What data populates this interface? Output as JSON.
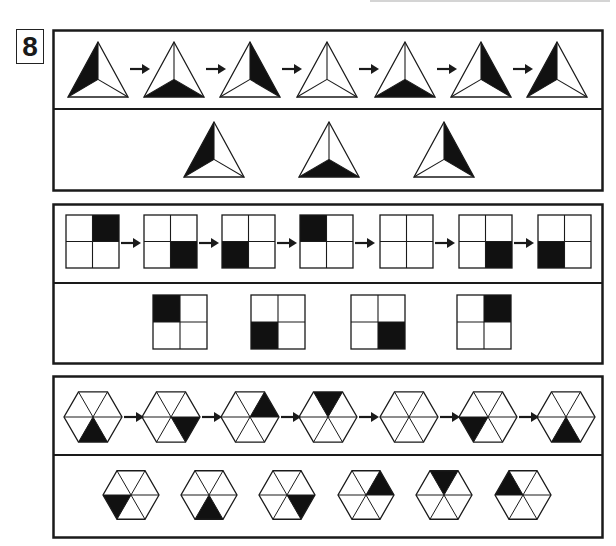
{
  "problem": {
    "number": "8"
  },
  "colors": {
    "ink": "#1a1a1a",
    "fill": "#111111",
    "background": "#ffffff"
  },
  "panels": [
    {
      "type": "triangle",
      "sequence": [
        "left",
        "bottom",
        "right",
        "none",
        "bottom",
        "right",
        "left"
      ],
      "options": [
        "left",
        "bottom",
        "right"
      ]
    },
    {
      "type": "square",
      "sequence": [
        "top-right",
        "bottom-right",
        "bottom-left",
        "top-left",
        "none",
        "bottom-right",
        "bottom-left"
      ],
      "options": [
        "top-left",
        "bottom-left",
        "bottom-right",
        "top-right"
      ]
    },
    {
      "type": "hexagon",
      "sequence": [
        "bottom",
        "lower-right",
        "upper-right",
        "top",
        "none",
        "lower-left",
        "bottom"
      ],
      "options": [
        "lower-left",
        "bottom",
        "lower-right",
        "upper-right",
        "top",
        "upper-left"
      ]
    }
  ],
  "icons": {
    "arrow": "right-arrow-icon"
  }
}
